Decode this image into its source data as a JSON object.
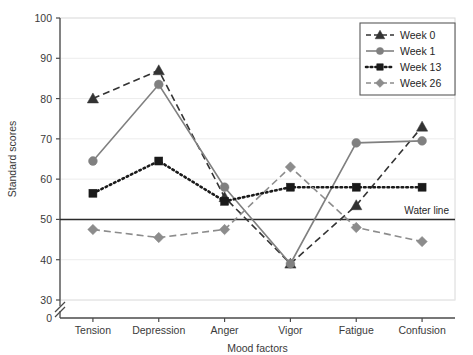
{
  "chart_data": {
    "type": "line",
    "title": "",
    "xlabel": "Mood factors",
    "ylabel": "Standard scores",
    "categories": [
      "Tension",
      "Depression",
      "Anger",
      "Vigor",
      "Fatigue",
      "Confusion"
    ],
    "ylim": [
      30,
      100
    ],
    "yticks": [
      0,
      30,
      40,
      50,
      60,
      70,
      80,
      90,
      100
    ],
    "y_axis_break": true,
    "y_axis_break_between": [
      0,
      30
    ],
    "grid": true,
    "grid_axis": "y",
    "legend_position": "top-right",
    "annotations": [
      {
        "label": "Water line",
        "y": 50,
        "type": "horizontal-reference-line"
      }
    ],
    "series": [
      {
        "name": "Week 0",
        "color": "#333333",
        "line_style": "dashed",
        "marker": "triangle",
        "values": [
          80,
          87,
          55.5,
          39,
          53.5,
          73
        ]
      },
      {
        "name": "Week 1",
        "color": "#808080",
        "line_style": "solid",
        "marker": "circle",
        "values": [
          64.5,
          83.5,
          58,
          39,
          69,
          69.5
        ]
      },
      {
        "name": "Week 13",
        "color": "#1a1a1a",
        "line_style": "dotted",
        "marker": "square",
        "values": [
          56.5,
          64.5,
          54.5,
          58,
          58,
          58
        ]
      },
      {
        "name": "Week 26",
        "color": "#8c8c8c",
        "line_style": "dashed",
        "marker": "diamond",
        "values": [
          47.5,
          45.5,
          47.5,
          63,
          48,
          44.5
        ]
      }
    ]
  },
  "axis": {
    "y_title": "Standard scores",
    "x_title": "Mood factors",
    "zero_label": "0"
  }
}
